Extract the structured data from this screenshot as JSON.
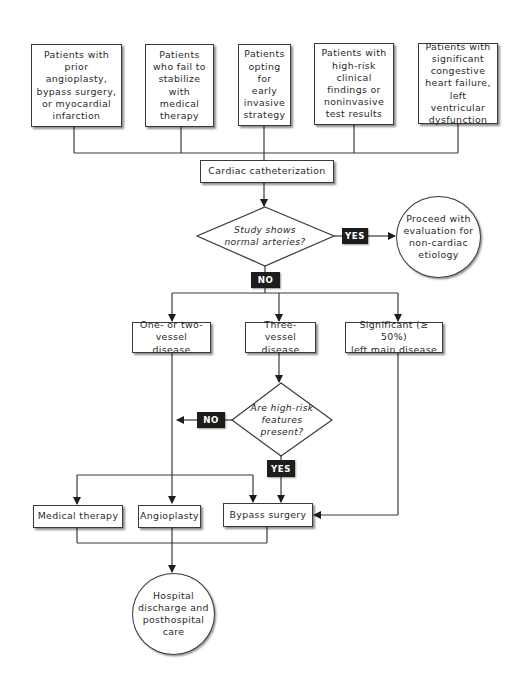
{
  "diagram": {
    "entry_boxes": [
      {
        "label": "Patients with\nprior\nangioplasty,\nbypass surgery,\nor myocardial\ninfarction"
      },
      {
        "label": "Patients\nwho fail to\nstabilize\nwith\nmedical\ntherapy"
      },
      {
        "label": "Patients\nopting\nfor\nearly\ninvasive\nstrategy"
      },
      {
        "label": "Patients with\nhigh-risk\nclinical\nfindings or\nnoninvasive\ntest results"
      },
      {
        "label": "Patients with\nsignificant\ncongestive\nheart failure,\nleft ventricular\ndysfunction"
      }
    ],
    "catheterization": {
      "label": "Cardiac catheterization"
    },
    "decision_normal": {
      "question": "Study shows\nnormal arteries?",
      "yes_label": "YES",
      "no_label": "NO",
      "yes_outcome": "Proceed with\nevaluation for\nnon-cardiac\netiology"
    },
    "disease_boxes": [
      {
        "label": "One- or two-\nvessel disease"
      },
      {
        "label": "Three-vessel\ndisease"
      },
      {
        "label": "Significant (≥ 50%)\nleft main disease"
      }
    ],
    "decision_highrisk": {
      "question": "Are high-risk\nfeatures\npresent?",
      "yes_label": "YES",
      "no_label": "NO"
    },
    "treatment_boxes": [
      {
        "label": "Medical therapy"
      },
      {
        "label": "Angioplasty"
      },
      {
        "label": "Bypass surgery"
      }
    ],
    "final_outcome": {
      "label": "Hospital\ndischarge and\nposthospital\ncare"
    },
    "colors": {
      "line": "#3a3a3a",
      "tag_bg": "#1d1d1d",
      "tag_text": "#ffffff",
      "background": "#ffffff"
    }
  }
}
